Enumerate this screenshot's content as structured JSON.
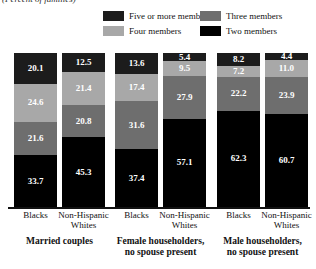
{
  "subtitle": "(Percent of families)",
  "legend": {
    "items": [
      {
        "label": "Five or more members",
        "color": "#1c1c1c",
        "icon": "legend-swatch"
      },
      {
        "label": "Three members",
        "color": "#6e6e6e",
        "icon": "legend-swatch"
      },
      {
        "label": "Four members",
        "color": "#a8a8a8",
        "icon": "legend-swatch"
      },
      {
        "label": "Two members",
        "color": "#000000",
        "icon": "legend-swatch"
      }
    ]
  },
  "chart_data": {
    "type": "bar",
    "subtype": "stacked-100",
    "title": "",
    "subtitle": "(Percent of families)",
    "xlabel": "",
    "ylabel": "",
    "ylim": [
      0,
      100
    ],
    "grid": false,
    "legend_position": "top",
    "categories": [
      "Married couples - Blacks",
      "Married couples - Non-Hispanic Whites",
      "Female householders, no spouse present - Blacks",
      "Female householders, no spouse present - Non-Hispanic Whites",
      "Male householders, no spouse present - Blacks",
      "Male householders, no spouse present - Non-Hispanic Whites"
    ],
    "series": [
      {
        "name": "Five or more members",
        "color": "#1c1c1c",
        "values": [
          20.1,
          12.5,
          13.6,
          5.4,
          8.2,
          4.4
        ]
      },
      {
        "name": "Four members",
        "color": "#a8a8a8",
        "values": [
          24.6,
          21.4,
          17.4,
          9.5,
          7.2,
          11.0
        ]
      },
      {
        "name": "Three members",
        "color": "#6e6e6e",
        "values": [
          21.6,
          20.8,
          31.6,
          27.9,
          22.2,
          23.9
        ]
      },
      {
        "name": "Two members",
        "color": "#000000",
        "values": [
          33.7,
          45.3,
          37.4,
          57.1,
          62.3,
          60.7
        ]
      }
    ],
    "groups": [
      {
        "caption_line1": "Married couples",
        "caption_line2": "",
        "bars": [
          {
            "tick": "Blacks",
            "tick_line2": "",
            "segments": [
              {
                "series": "Five or more members",
                "value": 20.1,
                "label": "20.1",
                "color": "#1c1c1c"
              },
              {
                "series": "Four members",
                "value": 24.6,
                "label": "24.6",
                "color": "#a8a8a8"
              },
              {
                "series": "Three members",
                "value": 21.6,
                "label": "21.6",
                "color": "#6e6e6e"
              },
              {
                "series": "Two members",
                "value": 33.7,
                "label": "33.7",
                "color": "#000000"
              }
            ]
          },
          {
            "tick": "Non-Hispanic",
            "tick_line2": "Whites",
            "segments": [
              {
                "series": "Five or more members",
                "value": 12.5,
                "label": "12.5",
                "color": "#1c1c1c"
              },
              {
                "series": "Four members",
                "value": 21.4,
                "label": "21.4",
                "color": "#a8a8a8"
              },
              {
                "series": "Three members",
                "value": 20.8,
                "label": "20.8",
                "color": "#6e6e6e"
              },
              {
                "series": "Two members",
                "value": 45.3,
                "label": "45.3",
                "color": "#000000"
              }
            ]
          }
        ]
      },
      {
        "caption_line1": "Female householders,",
        "caption_line2": "no spouse present",
        "bars": [
          {
            "tick": "Blacks",
            "tick_line2": "",
            "segments": [
              {
                "series": "Five or more members",
                "value": 13.6,
                "label": "13.6",
                "color": "#1c1c1c"
              },
              {
                "series": "Four members",
                "value": 17.4,
                "label": "17.4",
                "color": "#a8a8a8"
              },
              {
                "series": "Three members",
                "value": 31.6,
                "label": "31.6",
                "color": "#6e6e6e"
              },
              {
                "series": "Two members",
                "value": 37.4,
                "label": "37.4",
                "color": "#000000"
              }
            ]
          },
          {
            "tick": "Non-Hispanic",
            "tick_line2": "Whites",
            "segments": [
              {
                "series": "Five or more members",
                "value": 5.4,
                "label": "5.4",
                "color": "#1c1c1c"
              },
              {
                "series": "Four members",
                "value": 9.5,
                "label": "9.5",
                "color": "#a8a8a8"
              },
              {
                "series": "Three members",
                "value": 27.9,
                "label": "27.9",
                "color": "#6e6e6e"
              },
              {
                "series": "Two members",
                "value": 57.1,
                "label": "57.1",
                "color": "#000000"
              }
            ]
          }
        ]
      },
      {
        "caption_line1": "Male householders,",
        "caption_line2": "no spouse present",
        "bars": [
          {
            "tick": "Blacks",
            "tick_line2": "",
            "segments": [
              {
                "series": "Five or more members",
                "value": 8.2,
                "label": "8.2",
                "color": "#1c1c1c"
              },
              {
                "series": "Four members",
                "value": 7.2,
                "label": "7.2",
                "color": "#a8a8a8"
              },
              {
                "series": "Three members",
                "value": 22.2,
                "label": "22.2",
                "color": "#6e6e6e"
              },
              {
                "series": "Two members",
                "value": 62.3,
                "label": "62.3",
                "color": "#000000"
              }
            ]
          },
          {
            "tick": "Non-Hispanic",
            "tick_line2": "Whites",
            "segments": [
              {
                "series": "Five or more members",
                "value": 4.4,
                "label": "4.4",
                "color": "#1c1c1c"
              },
              {
                "series": "Four members",
                "value": 11.0,
                "label": "11.0",
                "color": "#a8a8a8"
              },
              {
                "series": "Three members",
                "value": 23.9,
                "label": "23.9",
                "color": "#6e6e6e"
              },
              {
                "series": "Two members",
                "value": 60.7,
                "label": "60.7",
                "color": "#000000"
              }
            ]
          }
        ]
      }
    ]
  }
}
